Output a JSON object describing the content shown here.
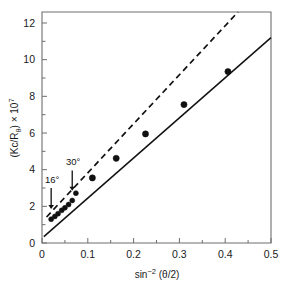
{
  "figure": {
    "background_color": "#ffffff",
    "ink_color": "#111111",
    "axis_color": "#6e6e6e"
  },
  "chart_data": {
    "type": "scatter",
    "title": "",
    "subtitle": "",
    "xlabel": "sin^-2 (θ/2)",
    "ylabel": "(Kc/R₀) × 10⁷",
    "xlabel_parts": {
      "base": "sin",
      "exponent": "−2",
      "argument": " (θ/2)"
    },
    "ylabel_parts": {
      "base": "(Kc/R",
      "subscript": "θ",
      "tail": ") × 10",
      "exponent": "7"
    },
    "xlim": [
      0,
      0.5
    ],
    "ylim": [
      0,
      12.6
    ],
    "grid": false,
    "legend": "none",
    "xticks": [
      0,
      0.1,
      0.2,
      0.3,
      0.4,
      0.5
    ],
    "xticklabels": [
      "0",
      "0.1",
      "0.2",
      "0.3",
      "0.4",
      "0.5"
    ],
    "x_minor_tick_step": 0.05,
    "yticks": [
      0,
      2,
      4,
      6,
      8,
      10,
      12
    ],
    "yticklabels": [
      "0",
      "2",
      "4",
      "6",
      "8",
      "10",
      "12"
    ],
    "y_minor_tick_step": 1,
    "series": [
      {
        "name": "measured points",
        "marker": "filled-circle",
        "values": [
          {
            "x": 0.02,
            "y": 1.3
          },
          {
            "x": 0.028,
            "y": 1.45
          },
          {
            "x": 0.035,
            "y": 1.6
          },
          {
            "x": 0.043,
            "y": 1.78
          },
          {
            "x": 0.05,
            "y": 1.92
          },
          {
            "x": 0.058,
            "y": 2.1
          },
          {
            "x": 0.066,
            "y": 2.32
          },
          {
            "x": 0.074,
            "y": 2.72
          },
          {
            "x": 0.11,
            "y": 3.55
          },
          {
            "x": 0.162,
            "y": 4.62
          },
          {
            "x": 0.226,
            "y": 5.95
          },
          {
            "x": 0.31,
            "y": 7.55
          },
          {
            "x": 0.406,
            "y": 9.35
          }
        ]
      },
      {
        "name": "overall fit line",
        "style": "solid",
        "endpoints": [
          {
            "x": 0.004,
            "y": 0.35
          },
          {
            "x": 0.5,
            "y": 11.2
          }
        ]
      },
      {
        "name": "limiting slope line",
        "style": "dashed",
        "endpoints": [
          {
            "x": 0.01,
            "y": 1.42
          },
          {
            "x": 0.428,
            "y": 12.6
          }
        ]
      }
    ],
    "annotations": [
      {
        "label": "16°",
        "x": 0.02,
        "marker": "down-arrow",
        "text_x": 0.022,
        "text_y": 3.3,
        "arrow_from_y": 3.0,
        "arrow_to_y": 1.85
      },
      {
        "label": "30°",
        "x": 0.066,
        "marker": "down-arrow",
        "text_x": 0.068,
        "text_y": 4.25,
        "arrow_from_y": 3.95,
        "arrow_to_y": 2.85
      }
    ]
  }
}
